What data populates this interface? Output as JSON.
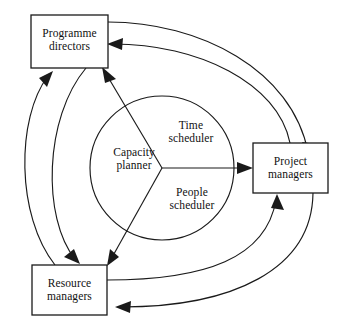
{
  "diagram": {
    "colors": {
      "stroke": "#1a1a1a",
      "background": "#ffffff",
      "text": "#111111"
    },
    "boxes": [
      {
        "id": "programme-directors",
        "line1": "Programme",
        "line2": "directors",
        "x": 31,
        "y": 15,
        "w": 77,
        "h": 53
      },
      {
        "id": "project-managers",
        "line1": "Project",
        "line2": "managers",
        "x": 253,
        "y": 143,
        "w": 75,
        "h": 50
      },
      {
        "id": "resource-managers",
        "line1": "Resource",
        "line2": "managers",
        "x": 32,
        "y": 265,
        "w": 75,
        "h": 50
      }
    ],
    "circle": {
      "cx": 162,
      "cy": 168,
      "r": 72,
      "sectors": [
        {
          "id": "capacity-planner",
          "line1": "Capacity",
          "line2": "planner"
        },
        {
          "id": "time-scheduler",
          "line1": "Time",
          "line2": "scheduler"
        },
        {
          "id": "people-scheduler",
          "line1": "People",
          "line2": "scheduler"
        }
      ]
    },
    "spokes": [
      {
        "id": "capacity-to-programme-directors",
        "from": "centre",
        "to": "programme-directors"
      },
      {
        "id": "time-to-project-managers",
        "from": "centre",
        "to": "project-managers"
      },
      {
        "id": "people-to-resource-managers",
        "from": "centre",
        "to": "resource-managers"
      }
    ],
    "arcs": [
      {
        "id": "programme-directors-to-project-managers",
        "from": "programme-directors",
        "to": "project-managers"
      },
      {
        "id": "project-managers-to-programme-directors",
        "from": "project-managers",
        "to": "programme-directors"
      },
      {
        "id": "programme-directors-to-resource-managers",
        "from": "programme-directors",
        "to": "resource-managers"
      },
      {
        "id": "resource-managers-to-programme-directors",
        "from": "resource-managers",
        "to": "programme-directors"
      },
      {
        "id": "resource-managers-to-project-managers",
        "from": "resource-managers",
        "to": "project-managers"
      },
      {
        "id": "project-managers-to-resource-managers",
        "from": "project-managers",
        "to": "resource-managers"
      }
    ]
  }
}
